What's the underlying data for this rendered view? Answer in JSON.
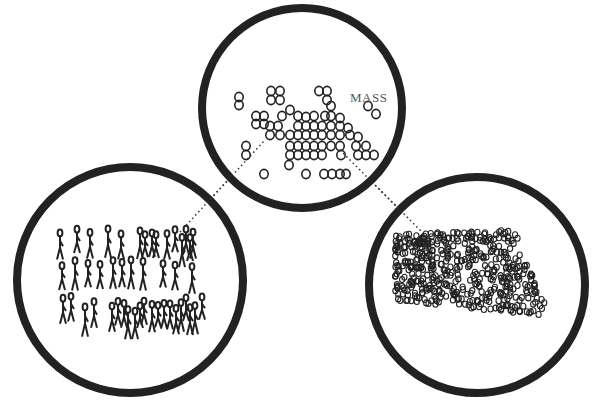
{
  "diagram": {
    "label": "MASS",
    "colors": {
      "stroke": "#222222",
      "background": "#ffffff",
      "label": "#555555"
    },
    "panels": [
      {
        "id": "crowd",
        "description": "individual stick figures",
        "cx": 130,
        "cy": 280,
        "r": 113
      },
      {
        "id": "mass",
        "description": "loose cluster of circles",
        "cx": 302,
        "cy": 108,
        "r": 100
      },
      {
        "id": "aggregate",
        "description": "dense aggregate of small circles",
        "cx": 477,
        "cy": 285,
        "r": 108
      }
    ],
    "connectors": [
      {
        "from": "crowd",
        "to": "mass",
        "style": "dotted"
      },
      {
        "from": "mass",
        "to": "aggregate",
        "style": "dotted"
      }
    ]
  }
}
